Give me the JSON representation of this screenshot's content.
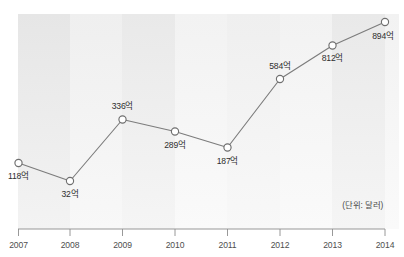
{
  "chart_data": {
    "type": "line",
    "title": "",
    "subtitle": "",
    "xlabel": "",
    "ylabel": "",
    "unit_note": "(단위: 달러)",
    "grid": false,
    "legend": "none",
    "categories": [
      "2007",
      "2008",
      "2009",
      "2010",
      "2011",
      "2012",
      "2013",
      "2014"
    ],
    "values": [
      118,
      32,
      336,
      289,
      187,
      584,
      812,
      894
    ],
    "value_labels": [
      "118억",
      "32억",
      "336억",
      "289억",
      "187억",
      "584억",
      "812억",
      "894억"
    ],
    "ylim": [
      0,
      950
    ],
    "series": [
      {
        "name": "",
        "values": [
          118,
          32,
          336,
          289,
          187,
          584,
          812,
          894
        ]
      }
    ]
  },
  "axis": {
    "x_ticks": [
      "2007",
      "2008",
      "2009",
      "2010",
      "2011",
      "2012",
      "2013",
      "2014"
    ]
  },
  "points": [
    {
      "year": "2007",
      "label": "118억",
      "cx": 18.5,
      "cy": 163.0,
      "lx": 18.5,
      "ly": 178.5,
      "anchor": "middle"
    },
    {
      "year": "2008",
      "label": "32억",
      "cx": 70.0,
      "cy": 181.0,
      "lx": 70.0,
      "ly": 196.5,
      "anchor": "middle"
    },
    {
      "year": "2009",
      "label": "336억",
      "cx": 122.5,
      "cy": 119.5,
      "lx": 122.5,
      "ly": 109.0,
      "anchor": "middle"
    },
    {
      "year": "2010",
      "label": "289억",
      "cx": 175.0,
      "cy": 131.5,
      "lx": 175.0,
      "ly": 148.0,
      "anchor": "middle"
    },
    {
      "year": "2011",
      "label": "187억",
      "cx": 227.5,
      "cy": 147.5,
      "lx": 227.5,
      "ly": 163.5,
      "anchor": "middle"
    },
    {
      "year": "2012",
      "label": "584억",
      "cx": 280.0,
      "cy": 79.0,
      "lx": 280.0,
      "ly": 68.5,
      "anchor": "middle"
    },
    {
      "year": "2013",
      "label": "812억",
      "cx": 332.5,
      "cy": 45.5,
      "lx": 332.5,
      "ly": 61.0,
      "anchor": "middle"
    },
    {
      "year": "2014",
      "label": "894억",
      "cx": 385.0,
      "cy": 22.0,
      "lx": 383.0,
      "ly": 38.5,
      "anchor": "middle"
    }
  ],
  "notes": {
    "unit": "(단위: 달러)"
  }
}
